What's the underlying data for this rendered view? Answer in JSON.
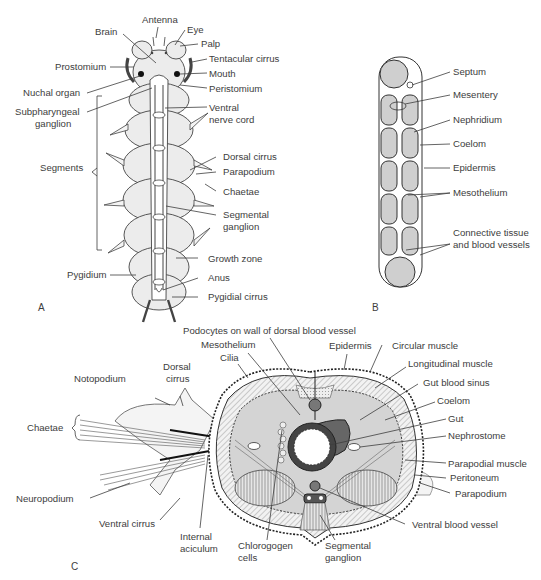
{
  "figure": {
    "panels": [
      "A",
      "B",
      "C"
    ],
    "panel_a": {
      "title": "A",
      "labels_left": [
        "Brain",
        "Prostomium",
        "Nuchal organ",
        "Subpharyngeal",
        "ganglion",
        "Segments",
        "Pygidium"
      ],
      "labels_right": [
        "Antenna",
        "Eye",
        "Palp",
        "Tentacular cirrus",
        "Mouth",
        "Peristomium",
        "Ventral",
        "nerve cord",
        "Dorsal cirrus",
        "Parapodium",
        "Chaetae",
        "Segmental",
        "ganglion",
        "Growth zone",
        "Anus",
        "Pygidial cirrus"
      ]
    },
    "panel_b": {
      "title": "B",
      "labels": [
        "Septum",
        "Mesentery",
        "Nephridium",
        "Coelom",
        "Epidermis",
        "Mesothelium",
        "Connective tissue",
        "and blood vessels"
      ]
    },
    "panel_c": {
      "title": "C",
      "labels_top": [
        "Podocytes on wall of dorsal blood vessel",
        "Mesothelium",
        "Cilia",
        "Epidermis",
        "Circular muscle"
      ],
      "labels_left": [
        "Notopodium",
        "Dorsal",
        "cirrus",
        "Chaetae",
        "Neuropodium",
        "Ventral cirrus",
        "Internal",
        "aciculum"
      ],
      "labels_bottom": [
        "Chlorogogen",
        "cells",
        "Segmental",
        "ganglion"
      ],
      "labels_right": [
        "Longitudinal muscle",
        "Gut blood sinus",
        "Coelom",
        "Gut",
        "Nephrostome",
        "Parapodial muscle",
        "Peritoneum",
        "Parapodium",
        "Ventral blood vessel"
      ]
    }
  }
}
